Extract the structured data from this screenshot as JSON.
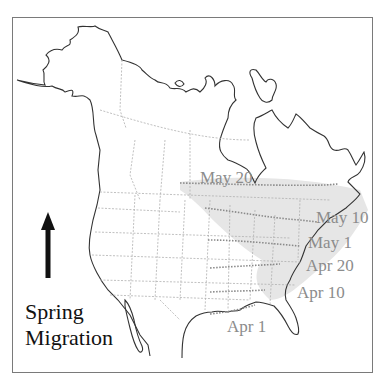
{
  "map": {
    "title_line1": "Spring",
    "title_line2": "Migration",
    "direction_icon": "north-arrow",
    "isochrons": [
      {
        "label": "May 20",
        "x": 200,
        "y": 169
      },
      {
        "label": "May 10",
        "x": 316,
        "y": 209
      },
      {
        "label": "May 1",
        "x": 308,
        "y": 234
      },
      {
        "label": "Apr 20",
        "x": 306,
        "y": 257
      },
      {
        "label": "Apr 10",
        "x": 297,
        "y": 284
      },
      {
        "label": "Apr 1",
        "x": 227,
        "y": 318
      }
    ],
    "colors": {
      "coastline": "#333333",
      "borders": "#b0b0b0",
      "isochron": "#8a8a8a",
      "range_fill": "#e4e4e4",
      "label": "#8c8c8c",
      "title": "#111111"
    }
  }
}
